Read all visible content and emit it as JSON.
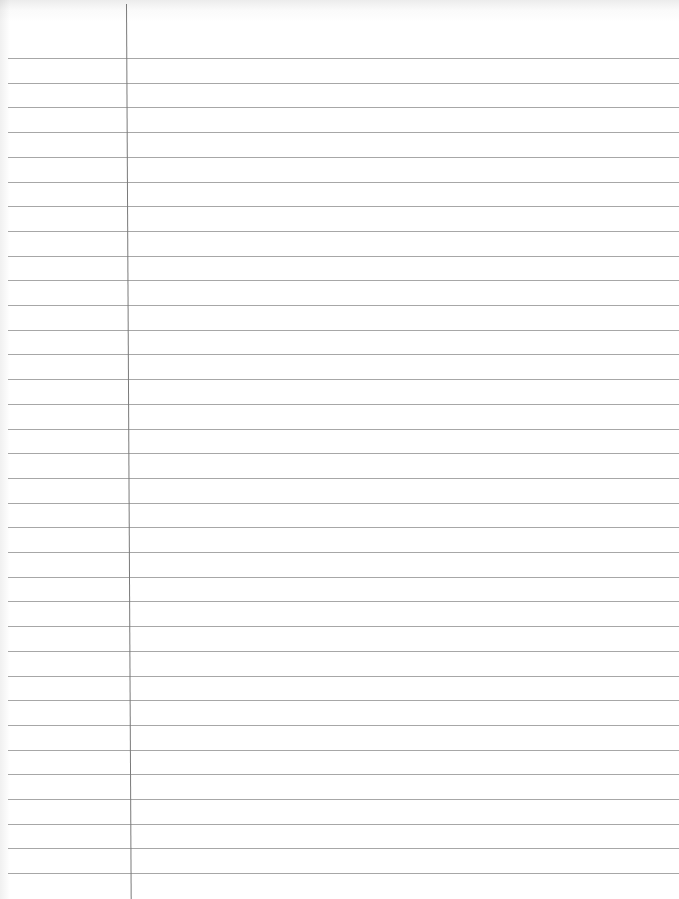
{
  "paper": {
    "type": "ruled notebook paper",
    "line_color": "#8a8a8a",
    "margin_line_color": "#7a7a7a",
    "background": "#ffffff",
    "ruled_lines": 34,
    "first_line_y": 58,
    "line_spacing": 24.7
  }
}
